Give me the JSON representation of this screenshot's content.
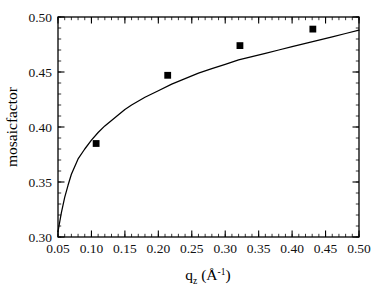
{
  "figure": {
    "background_color": "#ffffff",
    "foreground_color": "#000000",
    "frame": {
      "left": 58,
      "top": 17,
      "right": 359,
      "bottom": 237
    }
  },
  "axis_titles": {
    "x_base": "q",
    "x_subscript": "z",
    "x_unit_open": " (Å",
    "x_unit_sup": "-1",
    "x_unit_close": ")",
    "x_full": "q_z (Å^-1)",
    "y": "mosaicfactor"
  },
  "ticks": {
    "x_labels": [
      "0.05",
      "0.10",
      "0.15",
      "0.20",
      "0.25",
      "0.30",
      "0.35",
      "0.40",
      "0.45",
      "0.50"
    ],
    "x_values": [
      0.05,
      0.1,
      0.15,
      0.2,
      0.25,
      0.3,
      0.35,
      0.4,
      0.45,
      0.5
    ],
    "y_labels": [
      "0.30",
      "0.35",
      "0.40",
      "0.45",
      "0.50"
    ],
    "y_values": [
      0.3,
      0.35,
      0.4,
      0.45,
      0.5
    ],
    "x_minor_step": 0.01,
    "y_minor_step": 0.01,
    "direction": "in"
  },
  "chart_data": {
    "type": "scatter",
    "title": "",
    "xlabel": "q_z (Å^-1)",
    "ylabel": "mosaicfactor",
    "xlim": [
      0.05,
      0.5
    ],
    "ylim": [
      0.3,
      0.5
    ],
    "grid": false,
    "legend": "none",
    "series": [
      {
        "name": "measured mosaicfactor",
        "marker": "filled-square",
        "marker_color": "#000000",
        "x": [
          0.107,
          0.214,
          0.322,
          0.431
        ],
        "y": [
          0.385,
          0.447,
          0.474,
          0.489
        ]
      },
      {
        "name": "fit curve",
        "type": "line",
        "line_color": "#000000",
        "x": [
          0.05,
          0.055,
          0.06,
          0.065,
          0.07,
          0.08,
          0.09,
          0.1,
          0.11,
          0.12,
          0.13,
          0.14,
          0.15,
          0.16,
          0.18,
          0.2,
          0.22,
          0.24,
          0.26,
          0.28,
          0.3,
          0.32,
          0.34,
          0.36,
          0.38,
          0.4,
          0.42,
          0.44,
          0.46,
          0.48,
          0.5
        ],
        "y": [
          0.305,
          0.322,
          0.336,
          0.347,
          0.357,
          0.371,
          0.38,
          0.388,
          0.395,
          0.401,
          0.406,
          0.411,
          0.416,
          0.42,
          0.427,
          0.433,
          0.439,
          0.444,
          0.449,
          0.453,
          0.457,
          0.461,
          0.464,
          0.467,
          0.47,
          0.473,
          0.476,
          0.479,
          0.482,
          0.485,
          0.488
        ]
      }
    ]
  }
}
